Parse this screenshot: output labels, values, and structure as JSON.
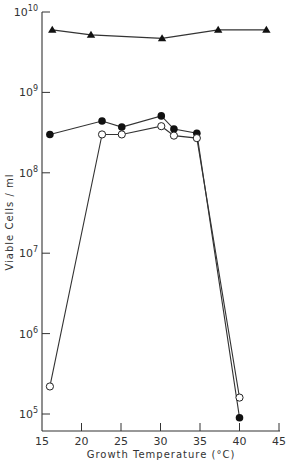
{
  "chart_data": {
    "type": "line",
    "title": "",
    "xlabel": "Growth Temperature (°C)",
    "ylabel": "Viable Cells / ml",
    "xlim": [
      15,
      45
    ],
    "ylim_log10": [
      4.8,
      10
    ],
    "yscale": "log",
    "x_ticks": [
      15,
      20,
      25,
      30,
      35,
      40,
      45
    ],
    "y_ticks": [
      {
        "base": "10",
        "exp": "5",
        "value": 5
      },
      {
        "base": "10",
        "exp": "6",
        "value": 6
      },
      {
        "base": "10",
        "exp": "7",
        "value": 7
      },
      {
        "base": "10",
        "exp": "8",
        "value": 8
      },
      {
        "base": "10",
        "exp": "9",
        "value": 9
      },
      {
        "base": "10",
        "exp": "10",
        "value": 10
      }
    ],
    "grid": false,
    "legend": null,
    "series": [
      {
        "name": "triangles",
        "marker": "filled-triangle",
        "x": [
          16.3,
          21.2,
          30.2,
          37.3,
          43.4
        ],
        "y": [
          6000000000.0,
          5200000000.0,
          4700000000.0,
          6000000000.0,
          6000000000.0
        ]
      },
      {
        "name": "filled-circles",
        "marker": "filled-circle",
        "x": [
          16.0,
          22.6,
          25.1,
          30.1,
          31.7,
          34.6,
          40.0
        ],
        "y": [
          300000000.0,
          440000000.0,
          370000000.0,
          510000000.0,
          350000000.0,
          310000000.0,
          90000.0
        ]
      },
      {
        "name": "open-circles",
        "marker": "open-circle",
        "x": [
          16.0,
          22.6,
          25.1,
          30.1,
          31.7,
          34.6,
          40.0
        ],
        "y": [
          220000.0,
          300000000.0,
          300000000.0,
          380000000.0,
          290000000.0,
          270000000.0,
          160000.0
        ]
      }
    ]
  }
}
